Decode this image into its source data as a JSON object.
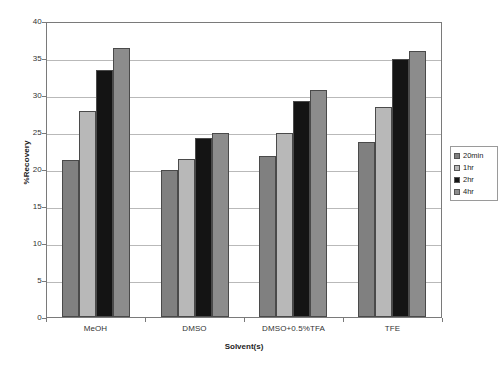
{
  "chart_data": {
    "type": "bar",
    "title": "",
    "xlabel": "Solvent(s)",
    "ylabel": "%Recovery",
    "categories": [
      "MeOH",
      "DMSO",
      "DMSO+0.5%TFA",
      "TFE"
    ],
    "series": [
      {
        "name": "20min",
        "color": "#808080",
        "values": [
          21.2,
          19.8,
          21.7,
          23.6
        ]
      },
      {
        "name": "1hr",
        "color": "#b8b8b8",
        "values": [
          27.8,
          21.4,
          24.8,
          28.4
        ]
      },
      {
        "name": "2hr",
        "color": "#141414",
        "values": [
          33.4,
          24.2,
          29.2,
          34.9
        ]
      },
      {
        "name": "4hr",
        "color": "#8c8c8c",
        "values": [
          36.3,
          24.8,
          30.7,
          36.0
        ]
      }
    ],
    "ylim": [
      0,
      40
    ],
    "ytick_step": 5,
    "yticks": [
      "40",
      "35",
      "30",
      "25",
      "20",
      "15",
      "10",
      "5",
      "0"
    ],
    "grid": true,
    "legend_position": "right"
  },
  "legend": {
    "items": [
      {
        "label": "20min"
      },
      {
        "label": "1hr"
      },
      {
        "label": "2hr"
      },
      {
        "label": "4hr"
      }
    ]
  }
}
